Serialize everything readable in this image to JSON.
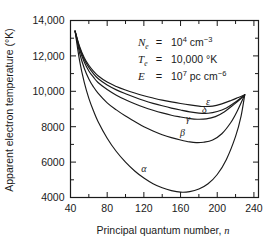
{
  "chart_data": {
    "type": "line",
    "title": "",
    "xlabel": "Principal quantum number, n",
    "ylabel": "Apparent electron temperature (°K)",
    "xlim": [
      40,
      245
    ],
    "ylim": [
      4000,
      14000
    ],
    "grid": false,
    "legend_position": "inline-curve-labels",
    "x_ticks_major": [
      40,
      80,
      120,
      160,
      200,
      240
    ],
    "x_ticks_major_labels": [
      "40",
      "80",
      "120",
      "160",
      "200",
      "240"
    ],
    "x_ticks_minor": [
      60,
      100,
      140,
      180,
      220
    ],
    "y_ticks_major": [
      4000,
      6000,
      8000,
      10000,
      12000,
      14000
    ],
    "y_ticks_major_labels": [
      "4000",
      "6000",
      "8000",
      "10,000",
      "12,000",
      "14,000"
    ],
    "y_ticks_minor": [
      5000,
      7000,
      9000,
      11000,
      13000
    ],
    "series": [
      {
        "name": "α",
        "label": "α",
        "label_x": 120,
        "label_y": 5450,
        "minimum": {
          "x": 160,
          "y": 4300
        },
        "points": [
          [
            45,
            13400
          ],
          [
            50,
            11700
          ],
          [
            55,
            10500
          ],
          [
            60,
            9600
          ],
          [
            65,
            8900
          ],
          [
            70,
            8300
          ],
          [
            80,
            7350
          ],
          [
            90,
            6600
          ],
          [
            100,
            6000
          ],
          [
            110,
            5500
          ],
          [
            120,
            5100
          ],
          [
            130,
            4780
          ],
          [
            140,
            4550
          ],
          [
            150,
            4390
          ],
          [
            160,
            4300
          ],
          [
            170,
            4330
          ],
          [
            180,
            4480
          ],
          [
            190,
            4780
          ],
          [
            200,
            5300
          ],
          [
            210,
            6150
          ],
          [
            220,
            7450
          ],
          [
            226,
            8600
          ],
          [
            230,
            9800
          ]
        ]
      },
      {
        "name": "β",
        "label": "β",
        "label_x": 162,
        "label_y": 7450,
        "minimum": {
          "x": 177,
          "y": 7100
        },
        "points": [
          [
            45,
            13400
          ],
          [
            50,
            12150
          ],
          [
            55,
            11300
          ],
          [
            60,
            10700
          ],
          [
            65,
            10250
          ],
          [
            70,
            9900
          ],
          [
            80,
            9350
          ],
          [
            90,
            8950
          ],
          [
            100,
            8600
          ],
          [
            110,
            8300
          ],
          [
            120,
            8000
          ],
          [
            130,
            7760
          ],
          [
            140,
            7550
          ],
          [
            150,
            7380
          ],
          [
            160,
            7250
          ],
          [
            170,
            7140
          ],
          [
            177,
            7100
          ],
          [
            185,
            7120
          ],
          [
            195,
            7250
          ],
          [
            205,
            7600
          ],
          [
            215,
            8250
          ],
          [
            222,
            8900
          ],
          [
            230,
            9800
          ]
        ]
      },
      {
        "name": "γ",
        "label": "γ",
        "label_x": 168,
        "label_y": 8250,
        "minimum": {
          "x": 178,
          "y": 8400
        },
        "points": [
          [
            45,
            13400
          ],
          [
            50,
            12350
          ],
          [
            55,
            11650
          ],
          [
            60,
            11150
          ],
          [
            65,
            10800
          ],
          [
            70,
            10500
          ],
          [
            80,
            10100
          ],
          [
            90,
            9780
          ],
          [
            100,
            9520
          ],
          [
            110,
            9300
          ],
          [
            120,
            9100
          ],
          [
            130,
            8930
          ],
          [
            140,
            8780
          ],
          [
            150,
            8650
          ],
          [
            160,
            8550
          ],
          [
            170,
            8460
          ],
          [
            178,
            8420
          ],
          [
            188,
            8440
          ],
          [
            198,
            8570
          ],
          [
            208,
            8850
          ],
          [
            218,
            9250
          ],
          [
            225,
            9550
          ],
          [
            230,
            9800
          ]
        ]
      },
      {
        "name": "δ",
        "label": "δ",
        "label_x": 186,
        "label_y": 8800,
        "minimum": {
          "x": 180,
          "y": 8750
        },
        "points": [
          [
            45,
            13400
          ],
          [
            50,
            12450
          ],
          [
            55,
            11800
          ],
          [
            60,
            11350
          ],
          [
            65,
            11000
          ],
          [
            70,
            10720
          ],
          [
            80,
            10350
          ],
          [
            90,
            10080
          ],
          [
            100,
            9860
          ],
          [
            110,
            9660
          ],
          [
            120,
            9480
          ],
          [
            130,
            9320
          ],
          [
            140,
            9180
          ],
          [
            150,
            9050
          ],
          [
            160,
            8940
          ],
          [
            170,
            8840
          ],
          [
            180,
            8770
          ],
          [
            190,
            8760
          ],
          [
            200,
            8860
          ],
          [
            210,
            9060
          ],
          [
            218,
            9320
          ],
          [
            225,
            9590
          ],
          [
            230,
            9800
          ]
        ]
      },
      {
        "name": "ε",
        "label": "ε",
        "label_x": 190,
        "label_y": 9250,
        "minimum": {
          "x": 185,
          "y": 9130
        },
        "points": [
          [
            45,
            13400
          ],
          [
            50,
            12520
          ],
          [
            55,
            11900
          ],
          [
            60,
            11470
          ],
          [
            65,
            11140
          ],
          [
            70,
            10880
          ],
          [
            80,
            10520
          ],
          [
            90,
            10270
          ],
          [
            100,
            10070
          ],
          [
            110,
            9900
          ],
          [
            120,
            9750
          ],
          [
            130,
            9620
          ],
          [
            140,
            9500
          ],
          [
            150,
            9400
          ],
          [
            160,
            9310
          ],
          [
            170,
            9230
          ],
          [
            180,
            9160
          ],
          [
            185,
            9140
          ],
          [
            195,
            9160
          ],
          [
            205,
            9290
          ],
          [
            215,
            9480
          ],
          [
            223,
            9650
          ],
          [
            230,
            9800
          ]
        ]
      }
    ],
    "annotations": [
      {
        "id": "electron-density",
        "symbol": "N",
        "subscript": "e",
        "equals": "=",
        "mantissa": "10",
        "exponent": "4",
        "unit": "cm",
        "unit_exponent": "−3",
        "text": "N_e = 10^4 cm^-3"
      },
      {
        "id": "electron-temperature",
        "symbol": "T",
        "subscript": "e",
        "equals": "=",
        "mantissa": "10,000",
        "exponent": "",
        "unit": "°K",
        "unit_exponent": "",
        "text": "T_e = 10,000 °K"
      },
      {
        "id": "emission-measure",
        "symbol": "E",
        "subscript": "",
        "equals": "=",
        "mantissa": "10",
        "exponent": "7",
        "unit": "pc cm",
        "unit_exponent": "−6",
        "text": "E = 10^7 pc cm^-6"
      }
    ]
  },
  "colors": {
    "ink": "#1a1a1a",
    "background": "#ffffff"
  }
}
